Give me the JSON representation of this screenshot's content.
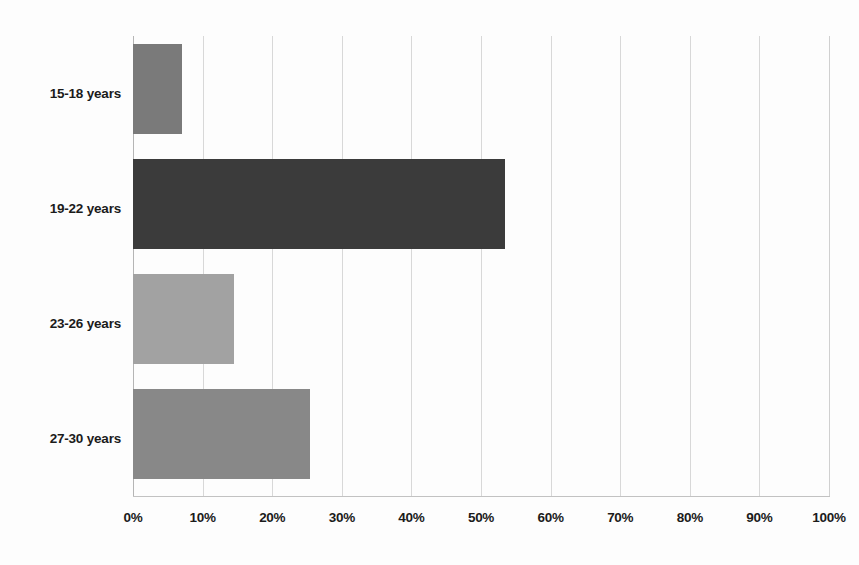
{
  "chart_data": {
    "type": "bar",
    "orientation": "horizontal",
    "title": "",
    "subtitle": "",
    "xlabel": "",
    "ylabel": "",
    "categories": [
      "15-18 years",
      "19-22 years",
      "23-26 years",
      "27-30 years"
    ],
    "values": [
      7,
      53.5,
      14.5,
      25.5
    ],
    "value_suffix": "%",
    "xlim": [
      0,
      100
    ],
    "xticks": [
      0,
      10,
      20,
      30,
      40,
      50,
      60,
      70,
      80,
      90,
      100
    ],
    "xtick_labels": [
      "0%",
      "10%",
      "20%",
      "30%",
      "40%",
      "50%",
      "60%",
      "70%",
      "80%",
      "90%",
      "100%"
    ],
    "grid": true,
    "grid_axis": "x",
    "legend": false,
    "legend_position": "none",
    "bar_colors": [
      "#7a7a7a",
      "#3b3b3b",
      "#a2a2a2",
      "#888888"
    ],
    "colors": {
      "background": "#fdfdfd",
      "gridline": "#d8d8d8",
      "axis": "#b5b5b5",
      "baseline": "#c2c2c2",
      "text": "#1b1b1b"
    }
  }
}
